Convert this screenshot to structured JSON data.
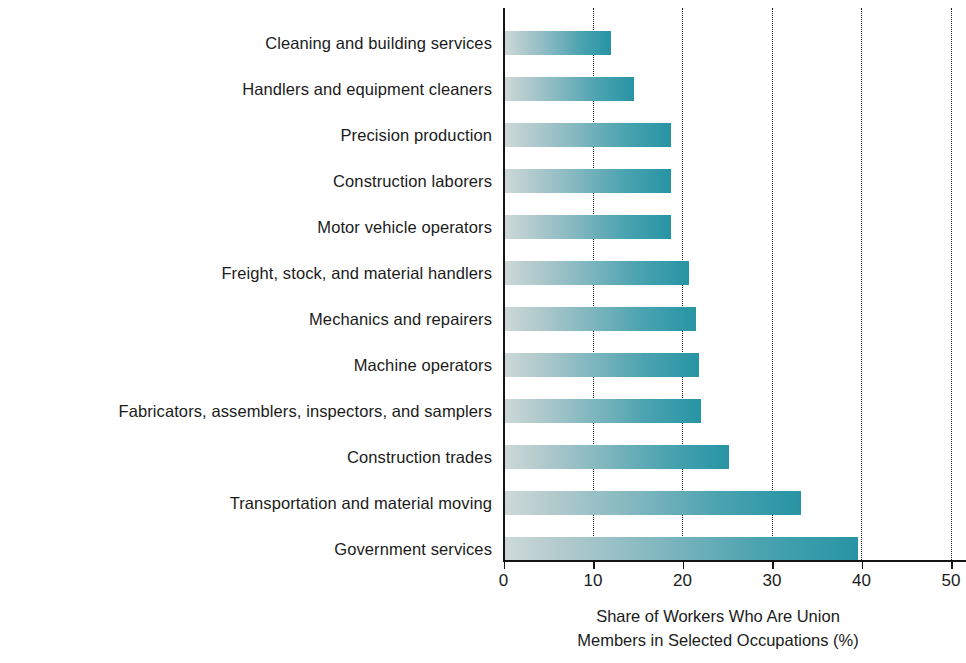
{
  "chart_data": {
    "type": "bar",
    "orientation": "horizontal",
    "title": "",
    "xlabel": "Share of Workers Who Are Union Members in Selected Occupations (%)",
    "xlabel_lines": [
      "Share of Workers Who Are Union",
      "Members in Selected Occupations (%)"
    ],
    "ylabel": "",
    "xlim": [
      0,
      50
    ],
    "xticks": [
      0,
      10,
      20,
      30,
      40,
      50
    ],
    "xtick_labels": [
      "0",
      "10",
      "20",
      "30",
      "40",
      "50"
    ],
    "grid": "vertical-dotted",
    "legend": "none",
    "categories": [
      "Cleaning and building services",
      "Handlers and equipment cleaners",
      "Precision production",
      "Construction laborers",
      "Motor vehicle operators",
      "Freight, stock, and material handlers",
      "Mechanics and repairers",
      "Machine operators",
      "Fabricators, assemblers, inspectors, and samplers",
      "Construction trades",
      "Transportation and material moving",
      "Government services"
    ],
    "values": [
      11.8,
      14.4,
      18.5,
      18.5,
      18.5,
      20.6,
      21.3,
      21.7,
      21.9,
      25.0,
      33.1,
      39.4
    ],
    "bar_gradient_start_color": "#cdd9d8",
    "bar_gradient_end_color": "#2794a4",
    "axis_color": "#141414",
    "text_color": "#1b1b1b",
    "background_color": "#ffffff"
  }
}
